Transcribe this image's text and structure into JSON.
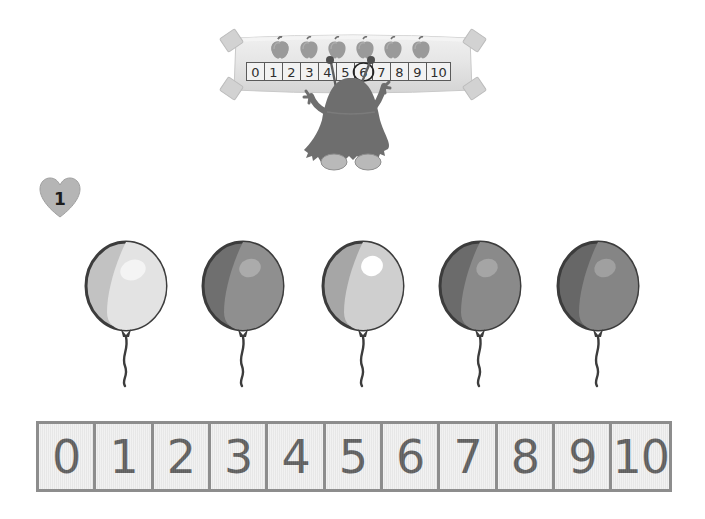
{
  "page": {
    "background_color": "#ffffff",
    "exercise_number": "1"
  },
  "banner": {
    "name": "number-line-banner",
    "apple_count": 6,
    "apple_color": "#9a9a9a",
    "apple_stem_color": "#6f6f6f",
    "numbers": [
      "0",
      "1",
      "2",
      "3",
      "4",
      "5",
      "6",
      "7",
      "8",
      "9",
      "10"
    ],
    "circled_number": "6",
    "paper_color": "#e4e4e4"
  },
  "character": {
    "name": "monster-character",
    "body_color": "#6e6e6e",
    "shoe_color": "#b9b9b9",
    "antennae": 2,
    "arms_raised": true
  },
  "balloons": {
    "count": 5,
    "items": [
      {
        "index": "1",
        "fill": "#e3e3e3",
        "shade": "#c2c2c2",
        "highlight": "#f4f4f4",
        "outline": "#3c3c3c",
        "x": 128
      },
      {
        "index": "2",
        "fill": "#8f8f8f",
        "shade": "#6f6f6f",
        "highlight": "#ababab",
        "outline": "#3c3c3c",
        "x": 245
      },
      {
        "index": "3",
        "fill": "#cfcfcf",
        "shade": "#a6a6a6",
        "highlight": "#ffffff",
        "outline": "#3c3c3c",
        "x": 365
      },
      {
        "index": "4",
        "fill": "#8a8a8a",
        "shade": "#6b6b6b",
        "highlight": "#a5a5a5",
        "outline": "#3c3c3c",
        "x": 482
      },
      {
        "index": "5",
        "fill": "#858585",
        "shade": "#676767",
        "highlight": "#a0a0a0",
        "outline": "#3c3c3c",
        "x": 600
      }
    ]
  },
  "number_strip": {
    "name": "number-line-strip",
    "cells": [
      "0",
      "1",
      "2",
      "3",
      "4",
      "5",
      "6",
      "7",
      "8",
      "9",
      "10"
    ],
    "border_color": "#8d8d8d",
    "cell_color": "#ececec",
    "text_color": "#2a2a2a"
  }
}
